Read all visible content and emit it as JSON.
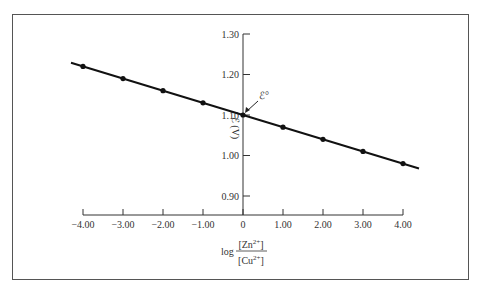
{
  "chart_data": {
    "type": "line",
    "title": "",
    "xlabel": "log [Zn2+]/[Cu2+]",
    "xlabel_parts": {
      "prefix": "log",
      "numerator": "[Zn",
      "numerator_sup": "2+",
      "numerator_close": "]",
      "denominator": "[Cu",
      "denominator_sup": "2+",
      "denominator_close": "]"
    },
    "ylabel": "ℰ (V)",
    "annotation": {
      "text": "ℰ°",
      "x": 0,
      "y": 1.1
    },
    "x": [
      -4,
      -3,
      -2,
      -1,
      0,
      1,
      2,
      3,
      4
    ],
    "series": [
      {
        "name": "cell potential",
        "values": [
          1.22,
          1.19,
          1.16,
          1.13,
          1.1,
          1.07,
          1.04,
          1.01,
          0.98
        ]
      }
    ],
    "xlim": [
      -4.3,
      4.4
    ],
    "ylim": [
      0.85,
      1.3
    ],
    "x_ticks": [
      "−4.00",
      "−3.00",
      "−2.00",
      "−1.00",
      "0",
      "1.00",
      "2.00",
      "3.00",
      "4.00"
    ],
    "y_ticks": [
      "1.30",
      "1.20",
      "1.10",
      "1.00",
      "0.90"
    ],
    "grid": false,
    "legend": null
  }
}
